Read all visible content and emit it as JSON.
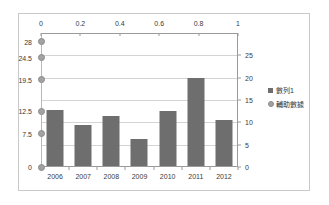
{
  "chart_data": {
    "type": "bar",
    "title": "",
    "subtitle": "",
    "xlabel": "",
    "ylabel": "",
    "grid": true,
    "legend_position": "right",
    "categories": [
      "2006",
      "2007",
      "2008",
      "2009",
      "2010",
      "2011",
      "2012"
    ],
    "series": [
      {
        "name": "數列1",
        "type": "bar",
        "axis": "right",
        "color": "#6e6e6e",
        "values": [
          12.6,
          9.2,
          11.2,
          6.1,
          12.3,
          19.8,
          10.2
        ]
      },
      {
        "name": "輔助數據",
        "type": "scatter",
        "axis": "left",
        "color": "#a3a3a3",
        "x": [
          0,
          0,
          0,
          0,
          0,
          0
        ],
        "values": [
          0,
          7.5,
          12.5,
          19.5,
          24.5,
          28
        ]
      }
    ],
    "axes": {
      "bottom": {
        "name": "category-axis",
        "ticks": [
          "2006",
          "2007",
          "2008",
          "2009",
          "2010",
          "2011",
          "2012"
        ]
      },
      "right": {
        "name": "primary-value-axis",
        "ticks": [
          "0",
          "5",
          "10",
          "15",
          "20",
          "25"
        ],
        "ylim": [
          0,
          30
        ]
      },
      "left": {
        "name": "secondary-value-axis",
        "ticks": [
          "0",
          "7.5",
          "12.5",
          "19.5",
          "24.5",
          "28"
        ],
        "ylim": [
          0,
          30
        ]
      },
      "top": {
        "name": "secondary-category-axis",
        "ticks": [
          "0",
          "0.2",
          "0.4",
          "0.6",
          "0.8",
          "1"
        ],
        "xlim": [
          0,
          1
        ]
      }
    }
  },
  "legend": {
    "items": [
      {
        "label": "數列1",
        "marker": "square-swatch"
      },
      {
        "label": "輔助數據",
        "marker": "circle-swatch"
      }
    ]
  },
  "colors": {
    "bar": "#6e6e6e",
    "marker_fill": "#a3a3a3",
    "marker_stroke": "#8a8a8a",
    "gridline": "#d4d4d4",
    "axis": "#9a9a9a",
    "frame": "#c9c9c9",
    "text": "#3a3a3a",
    "background": "#ffffff"
  }
}
